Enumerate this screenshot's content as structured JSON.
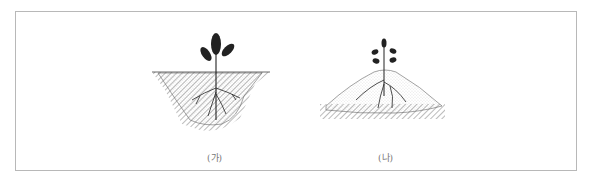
{
  "figure": {
    "panels": [
      {
        "id": "a",
        "label": "(가)",
        "description": "Seedling planted in a depression (concave pit) with roots in fill soil"
      },
      {
        "id": "b",
        "label": "(나)",
        "description": "Seedling planted on a mound above ground level"
      }
    ]
  }
}
